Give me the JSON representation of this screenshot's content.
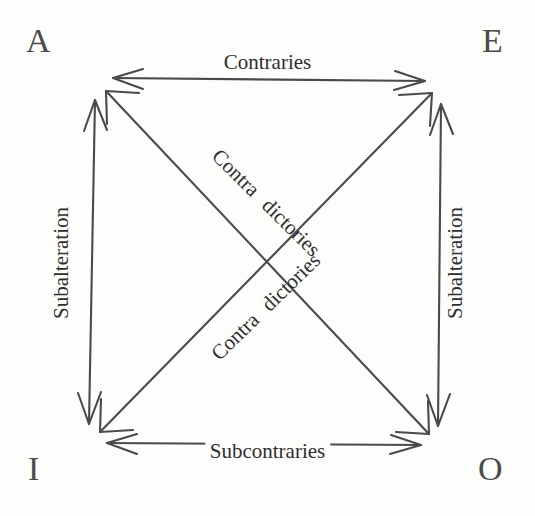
{
  "figure": {
    "name": "square-of-opposition",
    "background_color": "#fdfdfc",
    "stroke_color": "#4a4a4a",
    "text_color": "#2e2e2e",
    "width": 535,
    "height": 516
  },
  "corners": {
    "top_left": {
      "letter": "A",
      "x": 95,
      "y": 78
    },
    "top_right": {
      "letter": "E",
      "x": 443,
      "y": 83
    },
    "bottom_left": {
      "letter": "I",
      "x": 88,
      "y": 443
    },
    "bottom_right": {
      "letter": "O",
      "x": 440,
      "y": 445
    }
  },
  "relations": {
    "top_edge": {
      "label": "Contraries",
      "from": "A",
      "to": "E",
      "arrowheads": "both"
    },
    "bottom_edge": {
      "label": "Subcontraries",
      "from": "I",
      "to": "O",
      "arrowheads": "both"
    },
    "left_edge": {
      "label": "Subalteration",
      "from": "A",
      "to": "I",
      "arrowheads": "both"
    },
    "right_edge": {
      "label": "Subalteration",
      "from": "E",
      "to": "O",
      "arrowheads": "both"
    },
    "diagonal_descending": {
      "label_part1": "Contra",
      "label_part2": "dictories",
      "from": "A",
      "to": "O",
      "arrowheads": "both"
    },
    "diagonal_ascending": {
      "label_part1": "Contra",
      "label_part2": "dictories",
      "from": "I",
      "to": "E",
      "arrowheads": "both"
    }
  }
}
